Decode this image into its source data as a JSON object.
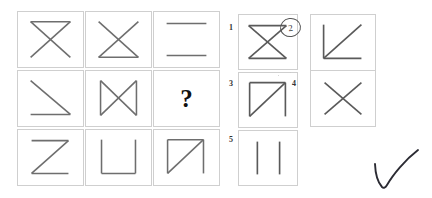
{
  "page": {
    "kind": "non-verbal-reasoning-matrix-puzzle",
    "background_color": "#ffffff",
    "stroke_color": "#6e6e6e",
    "box_border_color": "#cfcfcf"
  },
  "matrix": {
    "rows": 3,
    "columns": 3,
    "cells": [
      {
        "position": "row1-col1",
        "figure_name": "x-with-top-line",
        "description": "diagonal cross with a horizontal line across the top"
      },
      {
        "position": "row1-col2",
        "figure_name": "x-with-bottom-line",
        "description": "diagonal cross with a horizontal line across the bottom"
      },
      {
        "position": "row1-col3",
        "figure_name": "two-horizontal-lines",
        "description": "horizontal line at top and horizontal line at bottom"
      },
      {
        "position": "row2-col1",
        "figure_name": "diagonal-with-bottom-line",
        "description": "diagonal from top-left to bottom-right plus bottom horizontal line"
      },
      {
        "position": "row2-col2",
        "figure_name": "bowtie-x-with-verticals",
        "description": "diagonal cross with vertical lines on left and right"
      },
      {
        "position": "row2-col3",
        "figure_name": "question-mark-cell",
        "label": "?",
        "description": "the missing figure to be determined"
      },
      {
        "position": "row3-col1",
        "figure_name": "z-shape",
        "description": "letter Z: top line, diagonal, bottom line"
      },
      {
        "position": "row3-col2",
        "figure_name": "u-shape",
        "description": "letter U: left vertical, bottom line, right vertical"
      },
      {
        "position": "row3-col3",
        "figure_name": "n-shape-with-diagonal",
        "description": "left vertical, top line, right vertical plus diagonal bottom-left to top-right"
      }
    ],
    "question_label": "?"
  },
  "options": {
    "heading": "",
    "items": [
      {
        "number": "1",
        "figure_name": "hourglass-x-top-and-bottom-lines",
        "description": "diagonal cross with horizontal lines at both top and bottom",
        "selected": false
      },
      {
        "number": "2",
        "figure_name": "l-shape-with-diagonal",
        "description": "left vertical, bottom line plus diagonal bottom-left to top-right",
        "selected": true
      },
      {
        "number": "3",
        "figure_name": "n-shape-with-diagonal",
        "description": "left vertical, top line, right vertical plus diagonal",
        "selected": false
      },
      {
        "number": "4",
        "figure_name": "plain-x",
        "description": "plain diagonal cross",
        "selected": false
      },
      {
        "number": "5",
        "figure_name": "two-vertical-lines",
        "description": "two vertical lines side by side",
        "selected": false
      }
    ],
    "selected_number": "2"
  },
  "annotations": {
    "checkmark": {
      "name": "hand-drawn-check-mark",
      "color": "#2b2b33",
      "description": "hand drawn tick mark in the lower right corner"
    },
    "circle_on_option": {
      "name": "hand-drawn-circle",
      "target_option": "2",
      "description": "hand drawn circle around the option number 2"
    }
  }
}
